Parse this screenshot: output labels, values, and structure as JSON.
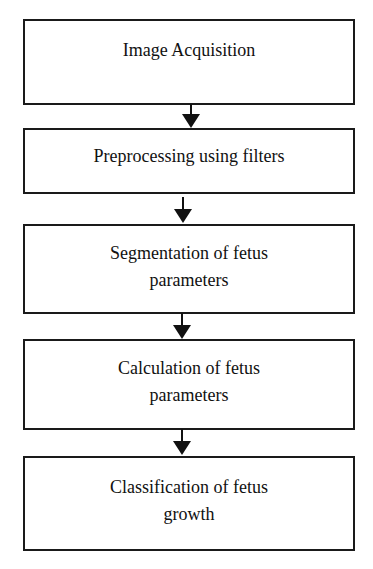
{
  "diagram": {
    "type": "flowchart",
    "direction": "top-to-bottom",
    "caption_remnant": "",
    "steps": [
      {
        "id": "step1",
        "label": "Image Acquisition"
      },
      {
        "id": "step2",
        "label": "Preprocessing using filters"
      },
      {
        "id": "step3",
        "label": "Segmentation of fetus\nparameters"
      },
      {
        "id": "step4",
        "label": "Calculation of fetus\nparameters"
      },
      {
        "id": "step5",
        "label": "Classification of fetus\ngrowth"
      }
    ],
    "edges": [
      {
        "from": "step1",
        "to": "step2"
      },
      {
        "from": "step2",
        "to": "step3"
      },
      {
        "from": "step3",
        "to": "step4"
      },
      {
        "from": "step4",
        "to": "step5"
      }
    ],
    "colors": {
      "line": "#111111",
      "background": "#ffffff",
      "text": "#111111"
    }
  }
}
